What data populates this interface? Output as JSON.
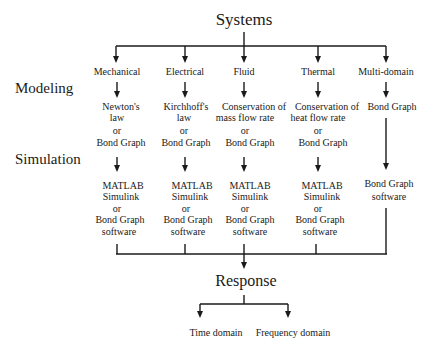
{
  "diagram": {
    "root": "Systems",
    "row_labels": {
      "modeling": "Modeling",
      "simulation": "Simulation"
    },
    "branches": [
      {
        "name": "Mechanical",
        "model": [
          "Newton's",
          "law",
          "or",
          "Bond Graph"
        ],
        "simulation": [
          "MATLAB",
          "Simulink",
          "or",
          "Bond Graph",
          "software"
        ]
      },
      {
        "name": "Electrical",
        "model": [
          "Kirchhoff's",
          "law",
          "or",
          "Bond Graph"
        ],
        "simulation": [
          "MATLAB",
          "Simulink",
          "or",
          "Bond Graph",
          "software"
        ]
      },
      {
        "name": "Fluid",
        "model": [
          "Conservation of",
          "mass flow rate",
          "or",
          "Bond Graph"
        ],
        "simulation": [
          "MATLAB",
          "Simulink",
          "or",
          "Bond Graph",
          "software"
        ]
      },
      {
        "name": "Thermal",
        "model": [
          "Conservation of",
          "heat flow rate",
          "or",
          "Bond Graph"
        ],
        "simulation": [
          "MATLAB",
          "Simulink",
          "or",
          "Bond Graph",
          "software"
        ]
      },
      {
        "name": "Multi-domain",
        "model": [
          "Bond Graph"
        ],
        "simulation": [
          "Bond Graph",
          "software"
        ]
      }
    ],
    "output": "Response",
    "outputs": [
      "Time domain",
      "Frequency domain"
    ],
    "line_color": "#1a1a1a"
  }
}
